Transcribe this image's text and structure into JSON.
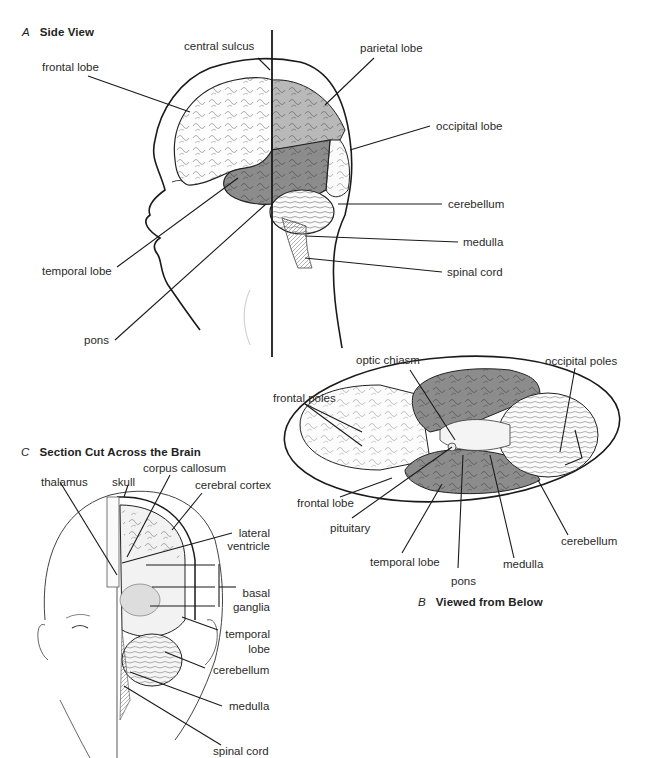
{
  "panels": {
    "a": {
      "letter": "A",
      "title": "Side View",
      "labels": {
        "central_sulcus": "central sulcus",
        "frontal_lobe": "frontal lobe",
        "parietal_lobe": "parietal lobe",
        "occipital_lobe": "occipital lobe",
        "cerebellum": "cerebellum",
        "medulla": "medulla",
        "spinal_cord": "spinal cord",
        "temporal_lobe": "temporal lobe",
        "pons": "pons"
      }
    },
    "b": {
      "letter": "B",
      "title": "Viewed from Below",
      "labels": {
        "optic_chiasm": "optic chiasm",
        "occipital_poles": "occipital poles",
        "frontal_poles": "frontal poles",
        "frontal_lobe": "frontal lobe",
        "pituitary": "pituitary",
        "temporal_lobe": "temporal lobe",
        "pons": "pons",
        "medulla": "medulla",
        "cerebellum": "cerebellum"
      }
    },
    "c": {
      "letter": "C",
      "title": "Section Cut Across the Brain",
      "labels": {
        "corpus_callosum": "corpus callosum",
        "thalamus": "thalamus",
        "skull": "skull",
        "cerebral_cortex": "cerebral cortex",
        "lateral_ventricle_1": "lateral",
        "lateral_ventricle_2": "ventricle",
        "basal_ganglia_1": "basal",
        "basal_ganglia_2": "ganglia",
        "temporal_lobe_1": "temporal",
        "temporal_lobe_2": "lobe",
        "cerebellum": "cerebellum",
        "medulla": "medulla",
        "spinal_cord": "spinal cord"
      }
    }
  },
  "colors": {
    "shade_dark": "#8c8c8c",
    "shade_light": "#b9b9b9",
    "line": "#1a1a1a"
  }
}
